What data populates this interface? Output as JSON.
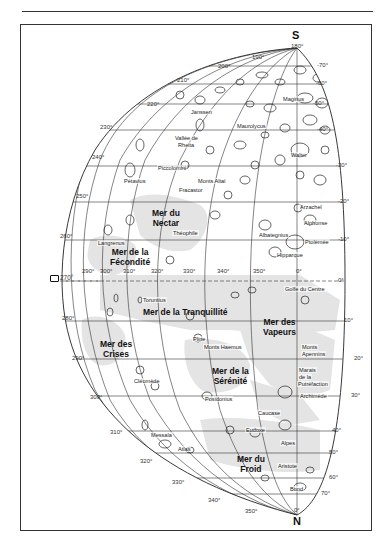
{
  "map": {
    "type": "lunar-map",
    "poles": {
      "south": "S",
      "north": "N"
    },
    "pole_degrees": {
      "south": "180°",
      "north": "0°"
    },
    "left_marker": "270°",
    "longitude_outer": [
      {
        "label": "190°",
        "x": 252,
        "y": 54
      },
      {
        "label": "200°",
        "x": 218,
        "y": 63
      },
      {
        "label": "210°",
        "x": 177,
        "y": 77
      },
      {
        "label": "220°",
        "x": 147,
        "y": 101
      },
      {
        "label": "230°",
        "x": 100,
        "y": 124
      },
      {
        "label": "240°",
        "x": 92,
        "y": 154
      },
      {
        "label": "250°",
        "x": 76,
        "y": 193
      },
      {
        "label": "260°",
        "x": 60,
        "y": 233
      },
      {
        "label": "280°",
        "x": 62,
        "y": 315
      },
      {
        "label": "290°",
        "x": 72,
        "y": 355
      },
      {
        "label": "300°",
        "x": 90,
        "y": 394
      },
      {
        "label": "310°",
        "x": 110,
        "y": 429
      },
      {
        "label": "320°",
        "x": 140,
        "y": 458
      },
      {
        "label": "330°",
        "x": 172,
        "y": 479
      },
      {
        "label": "340°",
        "x": 208,
        "y": 497
      },
      {
        "label": "350°",
        "x": 245,
        "y": 508
      }
    ],
    "longitude_inner": [
      {
        "label": "290°",
        "x": 82,
        "y": 268
      },
      {
        "label": "300°",
        "x": 100,
        "y": 268
      },
      {
        "label": "310°",
        "x": 123,
        "y": 268
      },
      {
        "label": "320°",
        "x": 151,
        "y": 268
      },
      {
        "label": "330°",
        "x": 183,
        "y": 268
      },
      {
        "label": "340°",
        "x": 217,
        "y": 268
      },
      {
        "label": "350°",
        "x": 253,
        "y": 268
      },
      {
        "label": "0°",
        "x": 296,
        "y": 268
      }
    ],
    "latitude": [
      {
        "label": "-70°",
        "x": 317,
        "y": 62
      },
      {
        "label": "-60°",
        "x": 316,
        "y": 80
      },
      {
        "label": "-50°",
        "x": 313,
        "y": 100
      },
      {
        "label": "-40°",
        "x": 317,
        "y": 126
      },
      {
        "label": "-30°",
        "x": 336,
        "y": 162
      },
      {
        "label": "-20°",
        "x": 338,
        "y": 198
      },
      {
        "label": "-10°",
        "x": 338,
        "y": 236
      },
      {
        "label": "0°",
        "x": 338,
        "y": 277
      },
      {
        "label": "10°",
        "x": 344,
        "y": 317
      },
      {
        "label": "20°",
        "x": 354,
        "y": 355
      },
      {
        "label": "30°",
        "x": 351,
        "y": 392
      },
      {
        "label": "40°",
        "x": 332,
        "y": 427
      },
      {
        "label": "50°",
        "x": 329,
        "y": 449
      },
      {
        "label": "60°",
        "x": 329,
        "y": 474
      },
      {
        "label": "70°",
        "x": 321,
        "y": 490
      }
    ],
    "maria": [
      {
        "name_line1": "Mer du",
        "name_line2": "Nectar",
        "x": 152,
        "y": 208
      },
      {
        "name_line1": "Mer de la",
        "name_line2": "Fécondité",
        "x": 110,
        "y": 247
      },
      {
        "name_line1": "Mer de la Tranquillité",
        "name_line2": "",
        "x": 143,
        "y": 307
      },
      {
        "name_line1": "Mer des",
        "name_line2": "Crises",
        "x": 100,
        "y": 339
      },
      {
        "name_line1": "Mer des",
        "name_line2": "Vapeurs",
        "x": 263,
        "y": 317
      },
      {
        "name_line1": "Mer de la",
        "name_line2": "Sérénité",
        "x": 212,
        "y": 366
      },
      {
        "name_line1": "Mer du",
        "name_line2": "Froid",
        "x": 237,
        "y": 454
      }
    ],
    "features": [
      {
        "name": "Maginus",
        "x": 282,
        "y": 96
      },
      {
        "name": "Janssen",
        "x": 190,
        "y": 109
      },
      {
        "name": "Maurolycus",
        "x": 236,
        "y": 123
      },
      {
        "name": "Vallée de",
        "x": 174,
        "y": 135
      },
      {
        "name": "Rheita",
        "x": 177,
        "y": 142
      },
      {
        "name": "Walter",
        "x": 290,
        "y": 152
      },
      {
        "name": "Piccolomini",
        "x": 157,
        "y": 165
      },
      {
        "name": "Pétavius",
        "x": 123,
        "y": 178
      },
      {
        "name": "Monts Altaï",
        "x": 197,
        "y": 178
      },
      {
        "name": "Fracastor",
        "x": 178,
        "y": 187
      },
      {
        "name": "Arzachel",
        "x": 299,
        "y": 204
      },
      {
        "name": "Théophile",
        "x": 172,
        "y": 230
      },
      {
        "name": "Alphonse",
        "x": 303,
        "y": 220
      },
      {
        "name": "Albategnius",
        "x": 258,
        "y": 232
      },
      {
        "name": "Langrenus",
        "x": 97,
        "y": 240
      },
      {
        "name": "Ptolémée",
        "x": 304,
        "y": 239
      },
      {
        "name": "Hipparque",
        "x": 276,
        "y": 252
      },
      {
        "name": "Golfe du Centre",
        "x": 284,
        "y": 286
      },
      {
        "name": "Toruntius",
        "x": 142,
        "y": 297
      },
      {
        "name": "Pline",
        "x": 192,
        "y": 336
      },
      {
        "name": "Monts Haemus",
        "x": 203,
        "y": 344
      },
      {
        "name": "Monts",
        "x": 301,
        "y": 344
      },
      {
        "name": "Apennins",
        "x": 301,
        "y": 351
      },
      {
        "name": "Marais",
        "x": 298,
        "y": 367
      },
      {
        "name": "de la",
        "x": 298,
        "y": 374
      },
      {
        "name": "Putréfaction",
        "x": 297,
        "y": 381
      },
      {
        "name": "Cléomède",
        "x": 133,
        "y": 378
      },
      {
        "name": "Archimède",
        "x": 299,
        "y": 393
      },
      {
        "name": "Posidonius",
        "x": 204,
        "y": 396
      },
      {
        "name": "Caucase",
        "x": 257,
        "y": 410
      },
      {
        "name": "Eudoxe",
        "x": 245,
        "y": 427
      },
      {
        "name": "Messala",
        "x": 150,
        "y": 432
      },
      {
        "name": "Alpes",
        "x": 280,
        "y": 440
      },
      {
        "name": "Atlas",
        "x": 177,
        "y": 446
      },
      {
        "name": "Aristote",
        "x": 277,
        "y": 463
      },
      {
        "name": "Bond",
        "x": 289,
        "y": 486
      }
    ]
  }
}
